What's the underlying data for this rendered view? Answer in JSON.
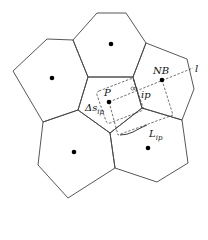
{
  "diagram": {
    "title": "",
    "cells": [
      {
        "id": "top",
        "points": "73,40 97,13 126,13 146,43 133,77 88,77",
        "center": [
          111,
          44
        ]
      },
      {
        "id": "left",
        "points": "13,71 47,39 73,40 88,77 78,110 43,122",
        "center": [
          52,
          78
        ]
      },
      {
        "id": "right-NB",
        "points": "146,43 187,59 194,89 182,120 142,108 133,77",
        "center": [
          162,
          80
        ]
      },
      {
        "id": "center-P",
        "points": "88,77 133,77 142,108 110,133 78,110",
        "center": [
          109,
          102
        ]
      },
      {
        "id": "bottom-left",
        "points": "43,122 78,110 110,133 115,168 68,198 38,165",
        "center": [
          74,
          152
        ]
      },
      {
        "id": "bottom-right",
        "points": "110,133 142,108 182,120 188,163 157,182 115,168",
        "center": [
          148,
          148
        ]
      }
    ],
    "labels": {
      "P": "P",
      "NB": "NB",
      "l": "l",
      "ip": "ip",
      "delta_s": "Δs",
      "delta_s_sub": "ip",
      "L": "L",
      "L_sub": "ip"
    },
    "colors": {
      "stroke": "#444444",
      "node": "#000000",
      "background": "#ffffff"
    }
  }
}
